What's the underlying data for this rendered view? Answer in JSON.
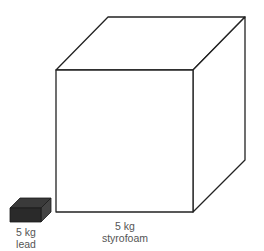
{
  "objects": [
    {
      "id": "lead",
      "mass": "5 kg",
      "material": "lead",
      "fill": "#2a2a2a"
    },
    {
      "id": "styrofoam",
      "mass": "5 kg",
      "material": "styrofoam",
      "fill": "#ffffff"
    }
  ],
  "colors": {
    "stroke": "#222222",
    "text": "#555555"
  }
}
